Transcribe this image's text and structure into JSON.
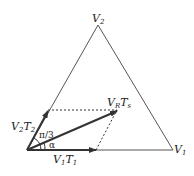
{
  "diagram": {
    "vertices": {
      "v2": "V",
      "v2_sub": "2",
      "v1": "V",
      "v1_sub": "1"
    },
    "vectors": {
      "v1t1": {
        "a": "V",
        "a_sub": "1",
        "b": "T",
        "b_sub": "1"
      },
      "v2t2": {
        "a": "V",
        "a_sub": "2",
        "b": "T",
        "b_sub": "2"
      },
      "vrts": {
        "a": "V",
        "a_sub": "R",
        "b": "T",
        "b_sub": "s"
      }
    },
    "angles": {
      "pi3": "π/3",
      "alpha": "α"
    },
    "colors": {
      "line": "#555555",
      "arrow": "#333333"
    }
  }
}
